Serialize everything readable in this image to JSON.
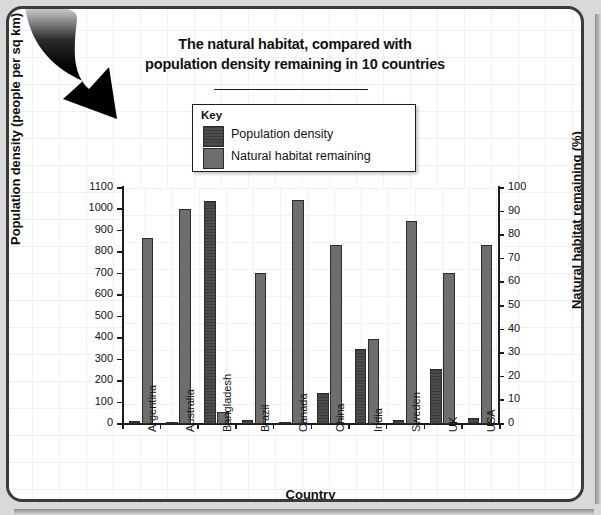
{
  "document": {
    "background_color": "#d9d9d9",
    "card_color": "#ffffff",
    "border_color": "#3a3a3a"
  },
  "decoration": {
    "arrow_icon": "curved-down-arrow-icon",
    "arrow_color": "#000000"
  },
  "key": {
    "title": "Key",
    "items": [
      {
        "label": "Population density",
        "swatch": "dark",
        "color": "#4c4c4c"
      },
      {
        "label": "Natural habitat remaining",
        "swatch": "light",
        "color": "#6e6e6e"
      }
    ]
  },
  "chart_data": {
    "type": "bar",
    "title": "The natural habitat, compared with population density remaining in 10 countries",
    "title_line1": "The natural habitat, compared with",
    "title_line2": "population density remaining in 10 countries",
    "xlabel": "Country",
    "ylabel": "Population density (people per sq km)",
    "ylabel_right": "Natural habitat remaining (%)",
    "grid": true,
    "legend_position": "top-center",
    "categories": [
      "Argentina",
      "Australia",
      "Bangladesh",
      "Brazil",
      "Canada",
      "China",
      "India",
      "Sweden",
      "UK",
      "USA"
    ],
    "ylim": [
      0,
      1100
    ],
    "yticks": [
      0,
      100,
      200,
      300,
      400,
      500,
      600,
      700,
      800,
      900,
      1000,
      1100
    ],
    "ylim_right": [
      0,
      100
    ],
    "yticks_right": [
      0,
      10,
      20,
      30,
      40,
      50,
      60,
      70,
      80,
      90,
      100
    ],
    "series": [
      {
        "name": "Population density",
        "unit": "people per sq km",
        "axis": "left",
        "color": "#4c4c4c",
        "values": [
          14,
          3,
          1040,
          20,
          3,
          145,
          350,
          20,
          255,
          30
        ]
      },
      {
        "name": "Natural habitat remaining",
        "unit": "%",
        "axis": "right",
        "color": "#6e6e6e",
        "values": [
          79,
          91,
          5,
          64,
          95,
          76,
          36,
          86,
          64,
          76
        ]
      }
    ]
  }
}
